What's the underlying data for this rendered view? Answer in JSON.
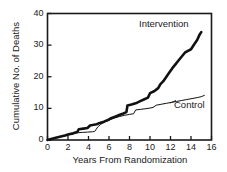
{
  "chart_data": {
    "type": "line",
    "title": "",
    "xlabel": "Years From Randomization",
    "ylabel": "Cumulative No. of Deaths",
    "xlim": [
      0,
      16
    ],
    "ylim": [
      0,
      40
    ],
    "xticks": [
      0,
      2,
      4,
      6,
      8,
      10,
      12,
      14,
      16
    ],
    "yticks": [
      0,
      10,
      20,
      30,
      40
    ],
    "xtick_labels": [
      "0",
      "2",
      "4",
      "6",
      "8",
      "10",
      "12",
      "14",
      "16"
    ],
    "ytick_labels": [
      "0",
      "10",
      "20",
      "30",
      "40"
    ],
    "grid": false,
    "legend_position": "inline-annotations",
    "annotations": [
      {
        "text": "Intervention",
        "x": 11.4,
        "y": 37.8
      },
      {
        "text": "Control",
        "x": 14.3,
        "y": 12.4
      }
    ],
    "series": [
      {
        "name": "Intervention",
        "color": "#111111",
        "line_width": 2.6,
        "points": [
          [
            0.0,
            0.0
          ],
          [
            0.35,
            0.3
          ],
          [
            0.8,
            0.7
          ],
          [
            1.2,
            1.0
          ],
          [
            1.7,
            1.4
          ],
          [
            2.1,
            1.8
          ],
          [
            2.5,
            2.1
          ],
          [
            2.9,
            2.5
          ],
          [
            3.05,
            3.4
          ],
          [
            3.5,
            3.6
          ],
          [
            3.9,
            3.8
          ],
          [
            4.15,
            4.6
          ],
          [
            4.5,
            4.8
          ],
          [
            4.8,
            5.0
          ],
          [
            5.1,
            5.4
          ],
          [
            5.5,
            5.8
          ],
          [
            5.9,
            6.3
          ],
          [
            6.2,
            6.9
          ],
          [
            6.6,
            7.4
          ],
          [
            7.0,
            7.9
          ],
          [
            7.4,
            8.4
          ],
          [
            7.7,
            8.8
          ],
          [
            7.8,
            10.9
          ],
          [
            8.2,
            11.2
          ],
          [
            8.6,
            11.6
          ],
          [
            9.0,
            12.2
          ],
          [
            9.4,
            12.8
          ],
          [
            9.8,
            13.4
          ],
          [
            10.0,
            14.8
          ],
          [
            10.4,
            15.4
          ],
          [
            10.8,
            16.4
          ],
          [
            11.0,
            17.6
          ],
          [
            11.3,
            18.6
          ],
          [
            11.6,
            20.0
          ],
          [
            11.9,
            21.4
          ],
          [
            12.2,
            22.8
          ],
          [
            12.5,
            24.0
          ],
          [
            12.8,
            25.2
          ],
          [
            13.1,
            26.4
          ],
          [
            13.4,
            27.6
          ],
          [
            13.7,
            28.2
          ],
          [
            14.0,
            28.7
          ],
          [
            14.3,
            30.2
          ],
          [
            14.6,
            31.6
          ],
          [
            14.85,
            33.4
          ],
          [
            15.0,
            34.1
          ]
        ]
      },
      {
        "name": "Control",
        "color": "#111111",
        "line_width": 1.0,
        "points": [
          [
            0.0,
            0.0
          ],
          [
            0.4,
            0.3
          ],
          [
            0.9,
            0.7
          ],
          [
            1.4,
            1.1
          ],
          [
            1.9,
            1.5
          ],
          [
            2.4,
            1.9
          ],
          [
            2.9,
            2.3
          ],
          [
            3.4,
            2.4
          ],
          [
            3.9,
            2.5
          ],
          [
            4.4,
            2.6
          ],
          [
            4.6,
            2.7
          ],
          [
            4.9,
            4.1
          ],
          [
            5.2,
            5.0
          ],
          [
            5.6,
            5.7
          ],
          [
            6.0,
            6.3
          ],
          [
            6.5,
            6.9
          ],
          [
            7.0,
            7.4
          ],
          [
            7.5,
            7.8
          ],
          [
            8.0,
            8.1
          ],
          [
            8.4,
            8.3
          ],
          [
            8.6,
            9.5
          ],
          [
            9.1,
            9.7
          ],
          [
            9.6,
            9.9
          ],
          [
            10.0,
            10.1
          ],
          [
            10.3,
            10.3
          ],
          [
            10.6,
            11.0
          ],
          [
            11.1,
            11.3
          ],
          [
            11.6,
            11.6
          ],
          [
            12.1,
            11.9
          ],
          [
            12.6,
            12.2
          ],
          [
            13.1,
            12.5
          ],
          [
            13.6,
            12.8
          ],
          [
            14.1,
            13.1
          ],
          [
            14.6,
            13.4
          ],
          [
            15.0,
            13.7
          ],
          [
            15.3,
            14.1
          ]
        ]
      }
    ]
  },
  "axes": {
    "ylabel": "Cumulative No. of Deaths",
    "xlabel": "Years From Randomization",
    "frame_color": "#1a1a1a"
  },
  "labels": {
    "intervention": "Intervention",
    "control": "Control"
  },
  "ticks": {
    "y": [
      "40",
      "30",
      "20",
      "10",
      "0"
    ],
    "x": [
      "0",
      "2",
      "4",
      "6",
      "8",
      "10",
      "12",
      "14",
      "16"
    ]
  }
}
